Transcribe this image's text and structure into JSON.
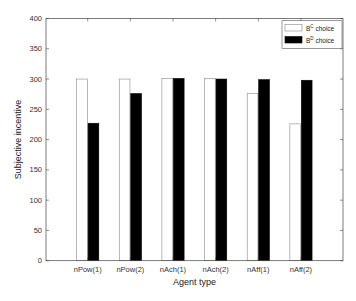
{
  "chart_data": {
    "type": "bar",
    "title": "",
    "xlabel": "Agent type",
    "ylabel": "Subjective incentive",
    "ylim": [
      0,
      400
    ],
    "yticks": [
      0,
      50,
      100,
      150,
      200,
      250,
      300,
      350,
      400
    ],
    "categories": [
      "nPow(1)",
      "nPow(2)",
      "nAch(1)",
      "nAch(2)",
      "nAff(1)",
      "nAff(2)"
    ],
    "series": [
      {
        "name": "B^C choice",
        "base": "B",
        "sup": "C",
        "suffix": " choice",
        "color": "#ffffff",
        "values": [
          300,
          300,
          301,
          301,
          276,
          226
        ]
      },
      {
        "name": "B^D choice",
        "base": "B",
        "sup": "D",
        "suffix": " choice",
        "color": "#000000",
        "values": [
          227,
          276,
          301,
          300,
          299,
          298
        ]
      }
    ],
    "legend_position": "upper right",
    "grid": false
  }
}
